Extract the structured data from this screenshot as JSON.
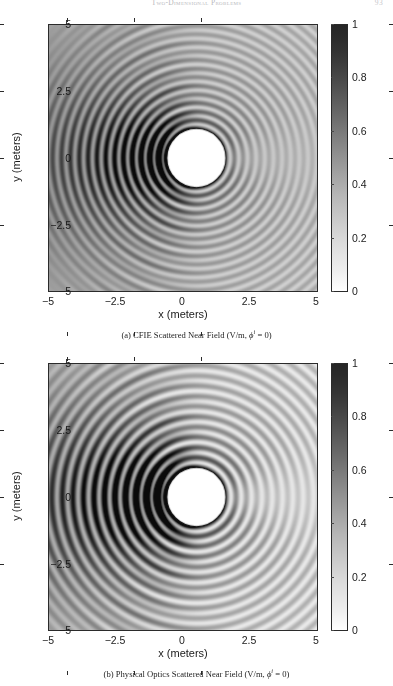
{
  "header": {
    "running_title": "Two-Dimensional Problems",
    "page_number": "93"
  },
  "figures": [
    {
      "id": "cfie",
      "caption_prefix": "(a)",
      "caption_text": "CFIE Scattered Near Field (V/m,",
      "caption_symbol": "ϕ",
      "caption_superscript": "i",
      "caption_suffix": "= 0)",
      "xlabel": "x (meters)",
      "ylabel": "y (meters)",
      "xticks": [
        "−5",
        "−2.5",
        "0",
        "2.5",
        "5"
      ],
      "yticks": [
        "5",
        "2.5",
        "0",
        "−2.5",
        "−5"
      ],
      "colorbar_ticks": [
        "1",
        "0.8",
        "0.6",
        "0.4",
        "0.2",
        "0"
      ]
    },
    {
      "id": "physical-optics",
      "caption_prefix": "(b)",
      "caption_text": "Physical Optics Scattered Near Field (V/m,",
      "caption_symbol": "ϕ",
      "caption_superscript": "i",
      "caption_suffix": "= 0)",
      "xlabel": "x (meters)",
      "ylabel": "y (meters)",
      "xticks": [
        "−5",
        "−2.5",
        "0",
        "2.5",
        "5"
      ],
      "yticks": [
        "5",
        "2.5",
        "0",
        "−2.5",
        "−5"
      ],
      "colorbar_ticks": [
        "1",
        "0.8",
        "0.6",
        "0.4",
        "0.2",
        "0"
      ]
    }
  ],
  "chart_data": {
    "type": "heatmap",
    "count": 2,
    "xlabel": "x (meters)",
    "ylabel": "y (meters)",
    "xlim": [
      -5,
      5
    ],
    "ylim": [
      -5,
      5
    ],
    "xticks": [
      -5,
      -2.5,
      0,
      2.5,
      5
    ],
    "yticks": [
      -5,
      -2.5,
      0,
      2.5,
      5
    ],
    "zlim": [
      0,
      1
    ],
    "colorbar_ticks": [
      0,
      0.2,
      0.4,
      0.6,
      0.8,
      1
    ],
    "colormap": "inverted grayscale (0 = white, 1 = black)",
    "grid": false,
    "legend": "none",
    "scatterer": {
      "shape": "circle",
      "center_x": 0.5,
      "center_y": 0.0,
      "radius": 1.1,
      "fill": "white",
      "edge": "black",
      "note": "perfectly conducting cylinder, field not plotted inside"
    },
    "incident_wave": {
      "direction_deg": 180,
      "phi_incident_deg": 0,
      "travel": "propagating in the -x direction",
      "description": "plane wave incident from +x"
    },
    "panels": [
      {
        "label": "(a)",
        "name": "CFIE Scattered Near Field",
        "units": "V/m",
        "wavenumber_rings_per_meter": 3.1,
        "backscatter_lobe_peak": 1.0,
        "forward_shadow_min": 0.05,
        "fringe_contrast": 0.72,
        "description": "Combined Field Integral Equation solution; fine uniform concentric ripples around the cylinder, smooth shadow boundary, standing-wave lobes on the illuminated (-x) side"
      },
      {
        "label": "(b)",
        "name": "Physical Optics Scattered Near Field",
        "units": "V/m",
        "wavenumber_rings_per_meter": 2.6,
        "backscatter_lobe_peak": 1.0,
        "forward_shadow_min": 0.02,
        "fringe_contrast": 0.95,
        "description": "Physical Optics approximation; coarser higher-contrast fringes, sharper specular lobes and a more pronounced forward shadow region"
      }
    ]
  }
}
